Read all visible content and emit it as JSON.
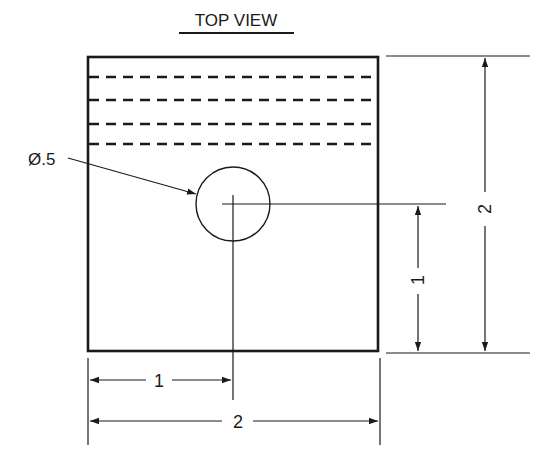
{
  "title": "TOP VIEW",
  "part": {
    "shape": "square block",
    "width": "2",
    "height": "2",
    "hidden_lines_count": 4
  },
  "hole": {
    "callout": "Ø.5",
    "diameter": 0.5
  },
  "dimensions": {
    "horizontal_hole_location": "1",
    "horizontal_overall": "2",
    "vertical_hole_location": "1",
    "vertical_overall": "2"
  },
  "colors": {
    "line": "#1a1a1a",
    "background": "#ffffff"
  }
}
